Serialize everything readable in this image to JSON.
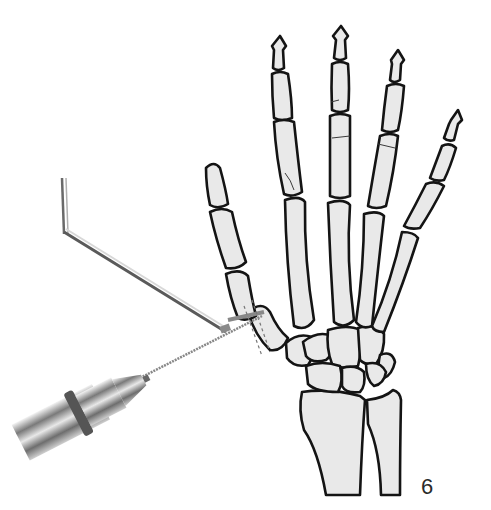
{
  "figure": {
    "label": "6",
    "instrument": "wire-driver-with-guide",
    "colors": {
      "bone_fill": "#e9e9e9",
      "outline": "#141414",
      "metal": "#9a9a9a"
    }
  }
}
